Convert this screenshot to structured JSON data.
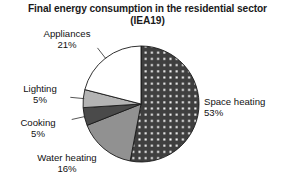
{
  "chart_data": {
    "type": "pie",
    "title": "Final energy consumption in the residential sector (IEA19)",
    "title_line1": "Final energy consumption in the residential sector",
    "title_line2": "(IEA19)",
    "xlabel": "",
    "ylabel": "",
    "legend_position": "none",
    "grid": false,
    "units": "percent",
    "start_angle_deg": 0,
    "direction": "clockwise",
    "categories": [
      "Space heating",
      "Water heating",
      "Cooking",
      "Lighting",
      "Appliances"
    ],
    "values": [
      53,
      16,
      5,
      5,
      21
    ],
    "slices": [
      {
        "name": "Space heating",
        "label": "Space heating",
        "value": 53,
        "value_text": "53%",
        "fill": "#3f3f3f",
        "pattern": "white-dots",
        "leader_line": false
      },
      {
        "name": "Water heating",
        "label": "Water heating",
        "value": 16,
        "value_text": "16%",
        "fill": "#919191",
        "pattern": "solid",
        "leader_line": false
      },
      {
        "name": "Cooking",
        "label": "Cooking",
        "value": 5,
        "value_text": "5%",
        "fill": "#4a4a4a",
        "pattern": "solid",
        "leader_line": true
      },
      {
        "name": "Lighting",
        "label": "Lighting",
        "value": 5,
        "value_text": "5%",
        "fill": "#b4b4b4",
        "pattern": "solid",
        "leader_line": true
      },
      {
        "name": "Appliances",
        "label": "Appliances",
        "value": 21,
        "value_text": "21%",
        "fill": "#ffffff",
        "pattern": "solid",
        "leader_line": true
      }
    ],
    "total": 100,
    "background": "#ffffff",
    "outline_color": "#1a1a1a"
  }
}
